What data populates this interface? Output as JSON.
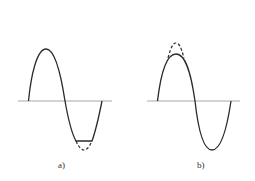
{
  "figure": {
    "panels": [
      {
        "id": "a",
        "label": "a)",
        "description": "Sine wave with negative half-cycle clipped flat; dashed line shows original trough"
      },
      {
        "id": "b",
        "label": "b)",
        "description": "Sine wave with positive half-cycle peak reduced; dashed line shows original peak"
      }
    ]
  },
  "colors": {
    "wave": "#2a2a2a",
    "axis": "#a8a8a8",
    "background": "#ffffff"
  }
}
